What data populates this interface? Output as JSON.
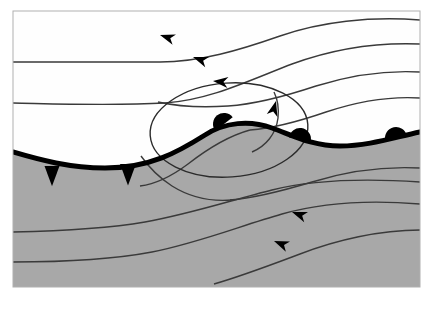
{
  "figure": {
    "type": "synoptic-weather-diagram",
    "width": 436,
    "height": 310
  },
  "colors": {
    "page_background": "#ffffff",
    "panel_background": "#fefefe",
    "cold_air_mass_fill": "#a8a8a8",
    "warm_air_mass_fill": "#fcfcfc",
    "front_line": "#000000",
    "streamline": "#3a3a3a",
    "panel_border": "#b0b0b0",
    "isobar_loop": "#2b2b2b"
  },
  "panel": {
    "x": 13,
    "y": 11,
    "width": 407,
    "height": 276,
    "border_width": 1
  },
  "air_masses": [
    {
      "name": "warm-air-mass",
      "label": "warm sector",
      "fill": "#fcfcfc",
      "region": "upper"
    },
    {
      "name": "cold-air-mass",
      "label": "cold air",
      "fill": "#a8a8a8",
      "region": "lower"
    }
  ],
  "front": {
    "name": "occluded-front-boundary",
    "label": "frontal boundary",
    "stroke": "#000000",
    "stroke_width": 5,
    "path": "M 13,152 C 40,160 70,168 105,168 C 150,168 178,152 205,135 C 225,122 250,120 272,128 C 292,135 312,146 340,146 C 368,146 392,138 420,132",
    "cold_front_symbols": [
      {
        "name": "cold-front-barb-1",
        "cx": 52,
        "cy": 166,
        "size": 15,
        "direction": "down"
      },
      {
        "name": "cold-front-barb-2",
        "cx": 128,
        "cy": 164,
        "size": 16,
        "direction": "down"
      }
    ],
    "warm_front_symbols": [
      {
        "name": "warm-front-bump-1",
        "cx": 224,
        "cy": 124,
        "r": 11,
        "direction": "up",
        "rotation": -38
      },
      {
        "name": "warm-front-bump-2",
        "cx": 300,
        "cy": 139,
        "r": 11,
        "direction": "up",
        "rotation": 8
      },
      {
        "name": "warm-front-bump-3",
        "cx": 396,
        "cy": 138,
        "r": 11,
        "direction": "up",
        "rotation": -12
      }
    ]
  },
  "isobar_loop": {
    "name": "closed-low-isobar",
    "label": "closed circulation isobar",
    "cx": 229,
    "cy": 130,
    "rx": 79,
    "ry": 47,
    "rotation": -4,
    "stroke": "#2b2b2b",
    "stroke_width": 1.4
  },
  "streamlines": [
    {
      "name": "streamline-upper-1",
      "label": "upper westerly flow 1",
      "path": "M 420,20 C 370,16 320,22 280,36 C 240,50 200,62 160,62 C 110,62 60,62 13,62",
      "arrows": [
        {
          "x": 160,
          "y": 35,
          "angle": 198
        }
      ]
    },
    {
      "name": "streamline-upper-2",
      "label": "upper westerly flow 2",
      "path": "M 420,44 C 372,42 330,50 292,64 C 250,80 210,100 165,103 C 112,106 60,104 13,103",
      "arrows": [
        {
          "x": 193,
          "y": 57,
          "angle": 200
        }
      ]
    },
    {
      "name": "streamline-right-1",
      "label": "right inflow 1",
      "path": "M 420,72 C 384,70 348,76 316,86 C 286,96 258,104 228,106 C 200,108 176,106 158,102",
      "arrows": []
    },
    {
      "name": "streamline-right-2",
      "label": "right inflow 2",
      "path": "M 420,98 C 388,96 356,102 326,112 C 300,121 276,128 250,130",
      "arrows": []
    },
    {
      "name": "streamline-loop-inflow",
      "label": "cyclonic inflow arrow",
      "path": "M 252,152 C 266,146 276,134 278,118 C 279,108 278,100 274,92",
      "arrows": [
        {
          "x": 276,
          "y": 101,
          "angle": 285
        }
      ]
    },
    {
      "name": "streamline-lower-1",
      "label": "lower southerly flow 1",
      "path": "M 13,232 C 60,231 105,229 145,222 C 190,214 232,200 272,190 C 312,180 360,178 420,182",
      "arrows": [
        {
          "x": 292,
          "y": 212,
          "angle": 200
        }
      ]
    },
    {
      "name": "streamline-lower-2",
      "label": "lower southerly flow 2",
      "path": "M 13,262 C 62,262 110,260 152,252 C 198,243 240,226 282,214 C 324,202 372,200 420,204",
      "arrows": [
        {
          "x": 274,
          "y": 241,
          "angle": 202
        }
      ]
    },
    {
      "name": "streamline-lower-3",
      "label": "lower southerly flow 3",
      "path": "M 420,230 C 380,230 336,240 300,254 C 268,266 242,276 214,284",
      "arrows": []
    },
    {
      "name": "streamline-cold-upper",
      "label": "cold sector flow near front",
      "path": "M 420,168 C 382,166 344,172 312,182 C 282,191 256,198 230,200",
      "arrows": []
    },
    {
      "name": "streamline-cold-branch",
      "label": "cold branch descending left",
      "path": "M 232,200 C 208,202 188,196 172,186 C 158,177 148,166 141,156",
      "arrows": []
    },
    {
      "name": "streamline-cold-branch-2",
      "label": "cold branch lower",
      "path": "M 250,130 C 228,136 206,150 188,164 C 172,176 156,184 140,186",
      "arrows": []
    }
  ],
  "arrow_style": {
    "length": 15,
    "width": 11,
    "fill": "#000000"
  }
}
